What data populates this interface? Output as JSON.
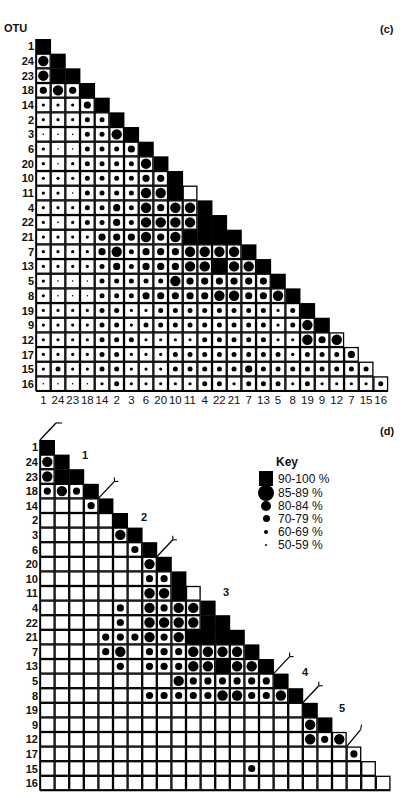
{
  "panels": {
    "c": {
      "label": "(c)",
      "axis_title": "OTU"
    },
    "d": {
      "label": "(d)"
    }
  },
  "otu_order": [
    "1",
    "24",
    "23",
    "18",
    "14",
    "2",
    "3",
    "6",
    "20",
    "10",
    "11",
    "4",
    "22",
    "21",
    "7",
    "13",
    "5",
    "8",
    "19",
    "9",
    "12",
    "17",
    "15",
    "16"
  ],
  "column_labels": [
    "1",
    "24",
    "23",
    "18",
    "14",
    "2",
    "3",
    "6",
    "20",
    "10",
    "11",
    "4",
    "22",
    "21",
    "7",
    "13",
    "5",
    "8",
    "19",
    "9",
    "12",
    "7",
    "15",
    "16"
  ],
  "key": {
    "title": "Key",
    "entries": [
      {
        "code": "B",
        "symbol": "black-square",
        "label": "90-100 %"
      },
      {
        "code": "L",
        "symbol": "large-dot",
        "label": "85-89 %"
      },
      {
        "code": "M",
        "symbol": "medium-dot",
        "label": "80-84 %"
      },
      {
        "code": "S",
        "symbol": "small-dot",
        "label": "70-79 %"
      },
      {
        "code": "T",
        "symbol": "tiny-dot",
        "label": "60-69 %"
      },
      {
        "code": "D",
        "symbol": "point",
        "label": "50-59 %"
      }
    ]
  },
  "clusters": [
    {
      "label": "1",
      "start_index": 0,
      "end_index": 3
    },
    {
      "label": "2",
      "start_index": 4,
      "end_index": 7
    },
    {
      "label": "3",
      "start_index": 8,
      "end_index": 15
    },
    {
      "label": "4",
      "start_index": 16,
      "end_index": 17
    },
    {
      "label": "5",
      "start_index": 18,
      "end_index": 20
    }
  ],
  "chart_data": [
    {
      "type": "heatmap",
      "title": "(c) Shaded similarity matrix of OTUs",
      "ylabel": "OTU",
      "categories": [
        "1",
        "24",
        "23",
        "18",
        "14",
        "2",
        "3",
        "6",
        "20",
        "10",
        "11",
        "4",
        "22",
        "21",
        "7",
        "13",
        "5",
        "8",
        "19",
        "9",
        "12",
        "17",
        "15",
        "16"
      ],
      "encoding": "lower-triangle; codes B=90-100%, L=85-89%, M=80-84%, S=70-79%, T=60-69%, D=50-59%",
      "rows": [
        "B",
        "LB",
        "LBB",
        "MLMB",
        "TTTMB",
        "TTTSSB",
        "DDDSSLB",
        "TDDSSSMB",
        "TDTSSSSLB",
        "TTTSSSSMMB",
        "TTDSSSSLLB",
        "TTTSSMSLMLLB",
        "TDTSSMSLLLLBB",
        "TTTTMMMLMLBBBB",
        "TTTTMLSMMMLLLLB",
        "TTTTSMSMMMLLBLLB",
        "TDDDSSSSSLMMMMMMB",
        "TDDDSSSMMMMMLLMMLB",
        "TTTTSSTTSSSSSSSSTSB",
        "TTTTSSTSSSSSSSSSTSLB",
        "TTTTSSSTTTTSSSSSTTLMLB",
        "TTTTSSTTTSSSSSSSSTSSSMB",
        "TSTTSSTTTSSSSSMSSSSSSSSB",
        "DDDDTSTTTTTSSTSSSTSTTTTSB"
      ]
    },
    {
      "type": "heatmap",
      "title": "(d) Similarity matrix showing values of 80% and above, with clusters 1-5",
      "categories": [
        "1",
        "24",
        "23",
        "18",
        "14",
        "2",
        "3",
        "6",
        "20",
        "10",
        "11",
        "4",
        "22",
        "21",
        "7",
        "13",
        "5",
        "8",
        "19",
        "9",
        "12",
        "17",
        "15",
        "16"
      ],
      "threshold_percent": 80,
      "cluster_labels": [
        "1",
        "2",
        "3",
        "4",
        "5"
      ]
    }
  ]
}
